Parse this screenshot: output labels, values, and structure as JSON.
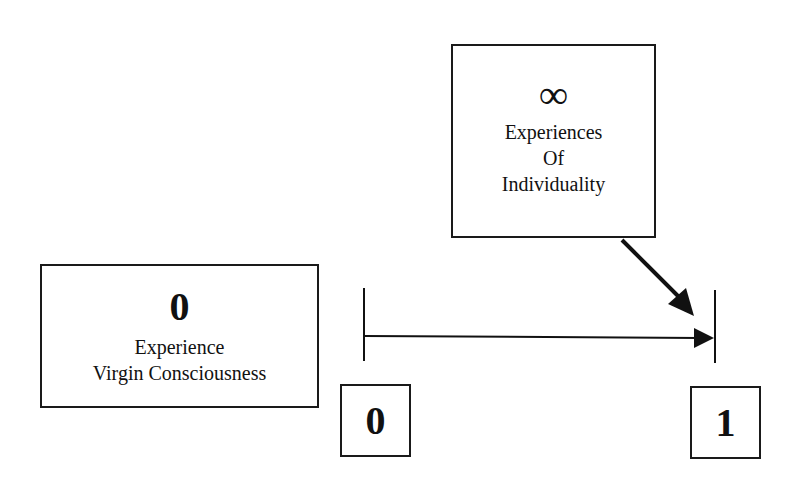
{
  "diagram": {
    "top_box": {
      "symbol": "∞",
      "lines": [
        "Experiences",
        "Of",
        "Individuality"
      ]
    },
    "left_box": {
      "symbol": "0",
      "lines": [
        "Experience",
        "Virgin Consciousness"
      ]
    },
    "scale": {
      "start_label": "0",
      "end_label": "1"
    },
    "colors": {
      "ink": "#111111",
      "background": "#ffffff"
    }
  }
}
